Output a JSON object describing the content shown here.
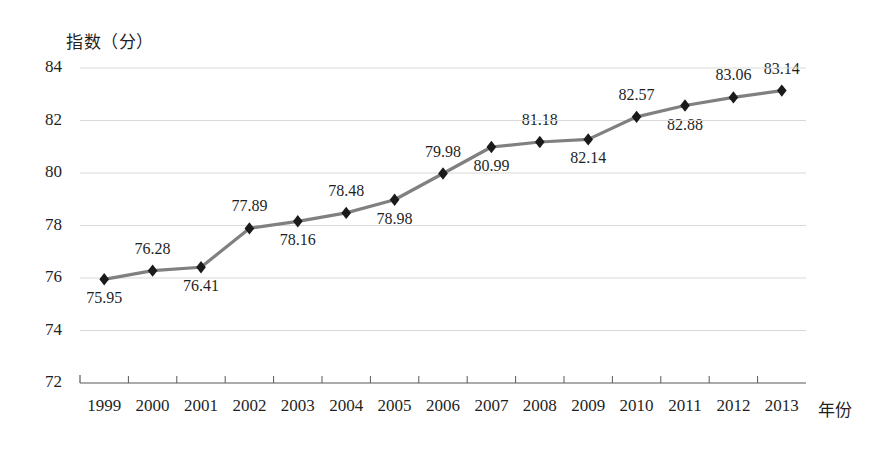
{
  "chart_data": {
    "type": "line",
    "title": "",
    "ylabel": "指数（分）",
    "xlabel": "年份",
    "grid": true,
    "legend": "none",
    "ylim": [
      72,
      84
    ],
    "ytick_labels": [
      "84",
      "82",
      "80",
      "78",
      "76",
      "74",
      "72"
    ],
    "ytick_values": [
      84,
      82,
      80,
      78,
      76,
      74,
      72
    ],
    "categories": [
      "1999",
      "2000",
      "2001",
      "2002",
      "2003",
      "2004",
      "2005",
      "2006",
      "2007",
      "2008",
      "2009",
      "2010",
      "2011",
      "2012",
      "2013"
    ],
    "values": [
      75.95,
      76.28,
      76.41,
      77.89,
      78.16,
      78.48,
      78.98,
      79.98,
      80.99,
      81.18,
      81.28,
      82.14,
      82.57,
      82.88,
      83.06
    ],
    "point_labels": [
      "75.95",
      "76.28",
      "76.41",
      "77.89",
      "78.16",
      "78.48",
      "78.98",
      "79.98",
      "80.99",
      "81.18",
      "82.14",
      "82.57",
      "82.88",
      "83.06",
      "83.14"
    ],
    "point_values": [
      75.95,
      76.28,
      76.41,
      77.89,
      78.16,
      78.48,
      78.98,
      79.98,
      80.99,
      81.18,
      81.28,
      82.14,
      82.57,
      82.88,
      83.14
    ],
    "label_placement": [
      "below",
      "above",
      "below",
      "above",
      "below",
      "above",
      "below",
      "above",
      "below",
      "above",
      "below",
      "above",
      "below",
      "above",
      "above"
    ],
    "series_name": "指数（分）",
    "colors": {
      "line": "#808080",
      "marker": "#1a1a1a",
      "grid": "#d9d9d9",
      "axis": "#595959",
      "text": "#1f1f1f"
    },
    "marker_shape": "diamond"
  }
}
